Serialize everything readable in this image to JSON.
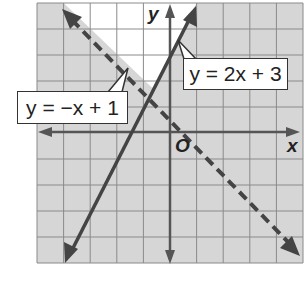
{
  "graph": {
    "grid": {
      "xmin": -5,
      "xmax": 5,
      "ymin": -5,
      "ymax": 5,
      "step": 1
    },
    "axes": {
      "x_label": "x",
      "y_label": "y",
      "origin_label": "O"
    },
    "lines": [
      {
        "equation": "y = 2x + 3",
        "slope": 2,
        "intercept": 3,
        "style": "solid"
      },
      {
        "equation": "y = −x + 1",
        "slope": -1,
        "intercept": 1,
        "style": "dashed"
      }
    ],
    "labels": {
      "line1": "y = 2x + 3",
      "line2": "y = −x + 1"
    },
    "colors": {
      "shade": "#d6d6d6",
      "unshaded": "#ffffff",
      "grid_line": "#8a8a8a",
      "line": "#444444",
      "axis": "#555555"
    }
  }
}
